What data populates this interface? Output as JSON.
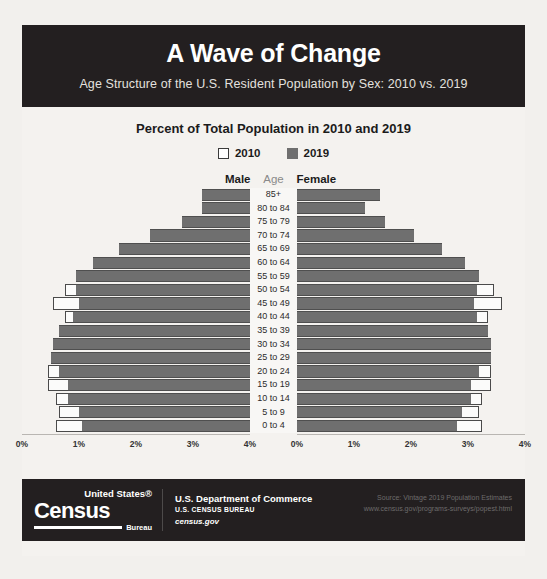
{
  "header": {
    "title": "A Wave of Change",
    "subtitle": "Age Structure of the U.S. Resident Population by Sex: 2010 vs. 2019"
  },
  "chart": {
    "title": "Percent of Total Population in 2010 and 2019",
    "legend": [
      {
        "label": "2010",
        "swatch": "legend-swatch-2010-icon",
        "color": "#ffffff"
      },
      {
        "label": "2019",
        "swatch": "legend-swatch-2019-icon",
        "color": "#6f6f6f"
      }
    ],
    "columns": {
      "male": "Male",
      "age": "Age",
      "female": "Female"
    }
  },
  "footer": {
    "logo": {
      "line1": "United States®",
      "line2": "Census",
      "line3": "Bureau"
    },
    "dept": {
      "line1": "U.S. Department of Commerce",
      "line2": "U.S. CENSUS BUREAU",
      "line3": "census.gov"
    },
    "source_line1": "Source: Vintage 2019 Population Estimates",
    "source_line2": "www.census.gov/programs-surveys/popest.html"
  },
  "chart_data": {
    "type": "bar",
    "subtype": "population-pyramid",
    "title": "Percent of Total Population in 2010 and 2019",
    "xlabel": "",
    "ylabel": "Age",
    "xlim": [
      0,
      4
    ],
    "xunit": "%",
    "xticks": [
      0,
      1,
      2,
      3,
      4
    ],
    "xtick_labels_male": [
      "4%",
      "3%",
      "2%",
      "1%",
      "0%"
    ],
    "xtick_labels_female": [
      "0%",
      "1%",
      "2%",
      "3%",
      "4%"
    ],
    "grid": false,
    "legend_position": "top-center",
    "categories": [
      "85+",
      "80 to 84",
      "75 to 79",
      "70 to 74",
      "65 to 69",
      "60 to 64",
      "55 to 59",
      "50 to 54",
      "45 to 49",
      "40 to 44",
      "35 to 39",
      "30 to 34",
      "25 to 29",
      "20 to 24",
      "15 to 19",
      "10 to 14",
      "5 to 9",
      "0 to 4"
    ],
    "series": [
      {
        "name": "Male 2010",
        "sex": "male",
        "year": 2010,
        "color": "#ffffff",
        "values": [
          0.7,
          0.65,
          0.9,
          1.25,
          1.55,
          2.2,
          2.75,
          3.25,
          3.45,
          3.25,
          3.1,
          3.2,
          3.45,
          3.55,
          3.55,
          3.4,
          3.35,
          3.4
        ]
      },
      {
        "name": "Male 2019",
        "sex": "male",
        "year": 2019,
        "color": "#6f6f6f",
        "values": [
          0.85,
          0.85,
          1.2,
          1.75,
          2.3,
          2.75,
          3.05,
          3.05,
          3.0,
          3.1,
          3.35,
          3.45,
          3.5,
          3.35,
          3.2,
          3.2,
          3.0,
          2.95
        ]
      },
      {
        "name": "Female 2010",
        "sex": "female",
        "year": 2010,
        "color": "#ffffff",
        "values": [
          1.25,
          0.9,
          1.15,
          1.45,
          1.75,
          2.4,
          2.95,
          3.45,
          3.6,
          3.35,
          3.2,
          3.25,
          3.4,
          3.4,
          3.4,
          3.25,
          3.2,
          3.25
        ]
      },
      {
        "name": "Female 2019",
        "sex": "female",
        "year": 2019,
        "color": "#6f6f6f",
        "values": [
          1.45,
          1.2,
          1.55,
          2.05,
          2.55,
          2.95,
          3.2,
          3.15,
          3.1,
          3.15,
          3.35,
          3.4,
          3.4,
          3.2,
          3.05,
          3.05,
          2.9,
          2.8
        ]
      }
    ]
  }
}
